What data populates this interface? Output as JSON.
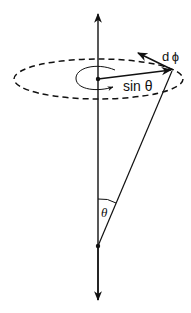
{
  "diagram": {
    "type": "spherical-geometry",
    "colors": {
      "stroke": "#111111",
      "background": "#ffffff"
    },
    "labels": {
      "dphi": "d ϕ",
      "sin_theta": "sin θ",
      "theta": "θ"
    },
    "elements": [
      "vertical-axis-up-arrow",
      "vertical-axis-down-arrow",
      "dashed-ellipse",
      "radius-arrow",
      "tangent-arrow",
      "rotation-arc-arrow",
      "cone-edge-line",
      "apex-angle-arc",
      "center-dot",
      "apex-dot"
    ]
  }
}
